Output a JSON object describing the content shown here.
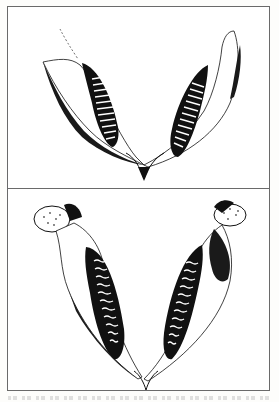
{
  "figure": {
    "panels": [
      {
        "id": "top",
        "description": "Line drawing of a lower jaw (two mandible halves in V shape) with parallel transverse tooth ridges, dorsal view"
      },
      {
        "id": "bottom",
        "description": "Line drawing of a lower jaw with condyles at upper ends and wavy enamel tooth ridges, dorsal view"
      }
    ],
    "caption": {
      "text": "",
      "note": "caption cut off at bottom edge; text not legible"
    }
  },
  "colors": {
    "ink": "#111111",
    "frame": "#6a6a6a",
    "paper": "#ffffff"
  }
}
